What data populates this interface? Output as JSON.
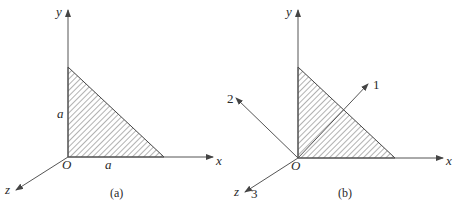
{
  "figure_a": {
    "caption": "(a)",
    "axes": {
      "x": "x",
      "y": "y",
      "z": "z"
    },
    "origin_label": "O",
    "side_labels": {
      "vertical": "a",
      "horizontal": "a"
    },
    "shape": "right-triangle-hatched"
  },
  "figure_b": {
    "caption": "(b)",
    "axes": {
      "x": "x",
      "y": "y",
      "z": "z"
    },
    "origin_label": "O",
    "principal_axes": {
      "axis1": "1",
      "axis2": "2",
      "axis3": "3"
    },
    "shape": "right-triangle-hatched"
  },
  "colors": {
    "line": "#555555",
    "text": "#2a2a2a",
    "background": "#ffffff"
  }
}
